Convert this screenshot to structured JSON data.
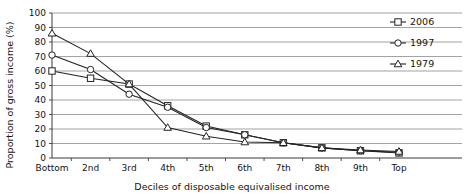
{
  "chart_data": {
    "type": "line",
    "title": "",
    "xlabel": "Deciles of disposable equivalised income",
    "ylabel": "Proportion of gross income (%)",
    "categories": [
      "Bottom",
      "2nd",
      "3rd",
      "4th",
      "5th",
      "6th",
      "7th",
      "8th",
      "9th",
      "Top"
    ],
    "ylim": [
      0,
      100
    ],
    "yticks": [
      0,
      10,
      20,
      30,
      40,
      50,
      60,
      70,
      80,
      90,
      100
    ],
    "grid": true,
    "legend_position": "top-right",
    "series": [
      {
        "name": "2006",
        "marker": "square",
        "values": [
          60,
          55,
          51,
          36,
          22,
          16,
          10.5,
          7,
          5,
          3.5
        ]
      },
      {
        "name": "1997",
        "marker": "circle",
        "values": [
          71,
          61,
          44,
          35,
          21,
          16,
          10.5,
          7,
          5,
          4
        ]
      },
      {
        "name": "1979",
        "marker": "triangle",
        "values": [
          86,
          72,
          51,
          21,
          15,
          11,
          10.5,
          7,
          5.5,
          4.5
        ]
      }
    ]
  },
  "legend": {
    "entries": [
      {
        "label": "2006",
        "marker": "square"
      },
      {
        "label": "1997",
        "marker": "circle"
      },
      {
        "label": "1979",
        "marker": "triangle"
      }
    ]
  },
  "colors": {
    "ink": "#232323",
    "grid": "#8c8c8c",
    "background": "#ffffff"
  }
}
